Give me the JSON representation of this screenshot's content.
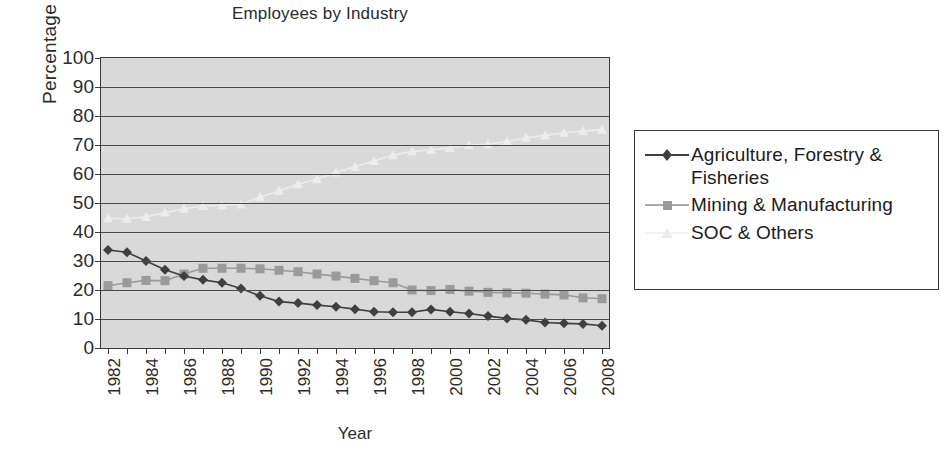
{
  "chart_data": {
    "type": "line",
    "title": "Employees by Industry",
    "xlabel": "Year",
    "ylabel": "Percentage",
    "grid": true,
    "legend_position": "right",
    "ylim": [
      0,
      100
    ],
    "yticks": [
      0,
      10,
      20,
      30,
      40,
      50,
      60,
      70,
      80,
      90,
      100
    ],
    "xlim": [
      1982,
      2008
    ],
    "x": [
      1982,
      1983,
      1984,
      1985,
      1986,
      1987,
      1988,
      1989,
      1990,
      1991,
      1992,
      1993,
      1994,
      1995,
      1996,
      1997,
      1998,
      1999,
      2000,
      2001,
      2002,
      2003,
      2004,
      2005,
      2006,
      2007,
      2008
    ],
    "xticklabels": [
      "1982",
      "1984",
      "1986",
      "1988",
      "1990",
      "1992",
      "1994",
      "1996",
      "1998",
      "2000",
      "2002",
      "2004",
      "2006",
      "2008"
    ],
    "series": [
      {
        "name": "Agriculture, Forestry & Fisheries",
        "marker": "diamond",
        "color": "#3f3f3f",
        "values": [
          33.8,
          33.0,
          30.0,
          27.0,
          24.8,
          23.5,
          22.5,
          20.5,
          18.0,
          16.0,
          15.5,
          14.8,
          14.2,
          13.4,
          12.5,
          12.3,
          12.3,
          13.3,
          12.5,
          11.9,
          11.0,
          10.2,
          9.7,
          8.8,
          8.5,
          8.3,
          7.7
        ]
      },
      {
        "name": "Mining & Manufacturing",
        "marker": "square",
        "color": "#9a9a9a",
        "values": [
          21.5,
          22.5,
          23.3,
          23.2,
          25.5,
          27.5,
          27.5,
          27.5,
          27.3,
          26.8,
          26.3,
          25.5,
          24.8,
          24.0,
          23.2,
          22.5,
          20.0,
          19.8,
          20.2,
          19.6,
          19.2,
          19.0,
          18.9,
          18.6,
          18.3,
          17.3,
          17.0
        ]
      },
      {
        "name": "SOC & Others",
        "marker": "triangle",
        "color": "#ececec",
        "values": [
          44.7,
          44.6,
          45.2,
          46.7,
          48.0,
          49.0,
          49.2,
          49.5,
          52.0,
          54.2,
          56.5,
          58.2,
          60.5,
          62.5,
          64.5,
          66.5,
          67.8,
          68.3,
          69.0,
          70.0,
          70.3,
          71.2,
          72.5,
          73.3,
          74.2,
          74.8,
          75.3
        ]
      }
    ]
  },
  "legend": {
    "items": [
      {
        "label": "Agriculture, Forestry & Fisheries"
      },
      {
        "label": "Mining & Manufacturing"
      },
      {
        "label": "SOC & Others"
      }
    ]
  },
  "colors": {
    "plot_background": "#d9d9d9",
    "gridline": "#4a4a4a",
    "axis": "#3a3a3a",
    "series_agriculture": "#3f3f3f",
    "series_mining": "#9a9a9a",
    "series_soc": "#ececec"
  }
}
